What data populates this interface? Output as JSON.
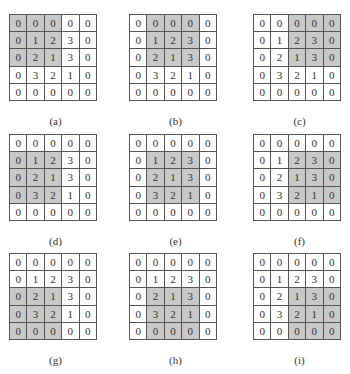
{
  "header": {
    "cropped_text": "· · · · · · ·  · · · · · ·        · · · · ·        · · · · ·"
  },
  "colors": {
    "highlight": "#c9c9c9",
    "border": "#555555",
    "cell_bg": "#ffffff"
  },
  "base_matrix": [
    [
      0,
      0,
      0,
      0,
      0
    ],
    [
      0,
      1,
      2,
      3,
      0
    ],
    [
      0,
      2,
      1,
      3,
      0
    ],
    [
      0,
      3,
      2,
      1,
      0
    ],
    [
      0,
      0,
      0,
      0,
      0
    ]
  ],
  "panels": [
    {
      "label": "(a)",
      "window_row": 0,
      "window_col": 0
    },
    {
      "label": "(b)",
      "window_row": 0,
      "window_col": 1
    },
    {
      "label": "(c)",
      "window_row": 0,
      "window_col": 2
    },
    {
      "label": "(d)",
      "window_row": 1,
      "window_col": 0
    },
    {
      "label": "(e)",
      "window_row": 1,
      "window_col": 1
    },
    {
      "label": "(f)",
      "window_row": 1,
      "window_col": 2
    },
    {
      "label": "(g)",
      "window_row": 2,
      "window_col": 0
    },
    {
      "label": "(h)",
      "window_row": 2,
      "window_col": 1
    },
    {
      "label": "(i)",
      "window_row": 2,
      "window_col": 2
    }
  ],
  "window_size": 3
}
